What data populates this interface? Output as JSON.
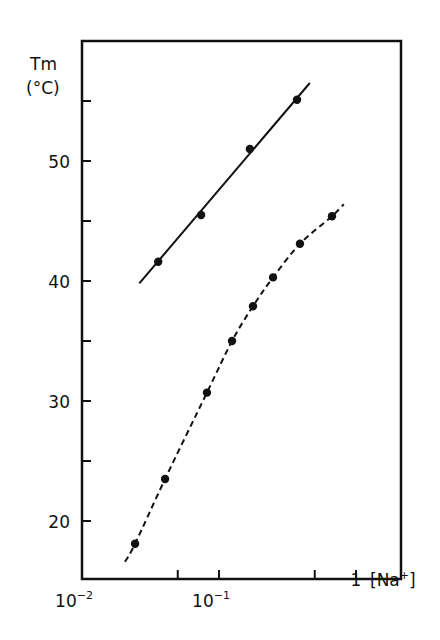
{
  "chart_data": {
    "type": "scatter",
    "title": "",
    "xlabel": "[Na+]",
    "ylabel": "Tm (°C)",
    "xscale": "log",
    "xlim": [
      0.01,
      2.0
    ],
    "ylim": [
      16.5,
      61.5
    ],
    "x_ticks": [
      {
        "value": 0.01,
        "label": "10^-2",
        "base": "10",
        "exp": "-2"
      },
      {
        "value": 0.05,
        "label": ""
      },
      {
        "value": 0.1,
        "label": "10^-1",
        "base": "10",
        "exp": "-1"
      },
      {
        "value": 0.5,
        "label": ""
      },
      {
        "value": 1,
        "label": "1"
      }
    ],
    "y_ticks": [
      {
        "value": 20,
        "label": "20"
      },
      {
        "value": 25,
        "label": ""
      },
      {
        "value": 30,
        "label": "30"
      },
      {
        "value": 35,
        "label": ""
      },
      {
        "value": 40,
        "label": "40"
      },
      {
        "value": 45,
        "label": ""
      },
      {
        "value": 50,
        "label": "50"
      },
      {
        "value": 55,
        "label": ""
      }
    ],
    "grid": false,
    "legend": null,
    "series": [
      {
        "name": "upper (solid fit)",
        "line_style": "solid",
        "points": [
          {
            "x": 0.036,
            "y": 41.6
          },
          {
            "x": 0.074,
            "y": 45.5
          },
          {
            "x": 0.168,
            "y": 51.0
          },
          {
            "x": 0.371,
            "y": 55.1
          }
        ],
        "fit_line": [
          {
            "x": 0.0262,
            "y": 39.8
          },
          {
            "x": 0.46,
            "y": 56.5
          }
        ]
      },
      {
        "name": "lower (dashed curve)",
        "line_style": "dashed",
        "points": [
          {
            "x": 0.0244,
            "y": 18.1
          },
          {
            "x": 0.0404,
            "y": 23.5
          },
          {
            "x": 0.0817,
            "y": 30.7
          },
          {
            "x": 0.1245,
            "y": 35.0
          },
          {
            "x": 0.177,
            "y": 37.9
          },
          {
            "x": 0.248,
            "y": 40.3
          },
          {
            "x": 0.39,
            "y": 43.1
          },
          {
            "x": 0.668,
            "y": 45.4
          }
        ],
        "curve_start": {
          "x": 0.0206,
          "y": 16.6
        },
        "curve_end": {
          "x": 0.815,
          "y": 46.4
        }
      }
    ]
  },
  "labels": {
    "y_title_line1": "Tm",
    "y_title_line2": "(°C)",
    "x_unit": "[Na",
    "x_unit_sup": "+",
    "x_unit_close": "]"
  }
}
